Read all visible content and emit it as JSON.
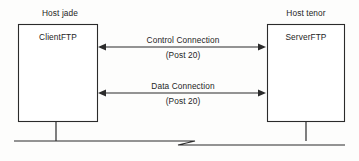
{
  "diagram": {
    "type": "network-diagram",
    "colors": {
      "line": "#2b2b2b",
      "text": "#242424",
      "background": "#fdfdfc",
      "box_fill": "#ffffff"
    },
    "hosts": [
      {
        "id": "left",
        "caption": "Host jade",
        "node_name": "ClientFTP",
        "role": "client"
      },
      {
        "id": "right",
        "caption": "Host tenor",
        "node_name": "ServerFTP",
        "role": "server"
      }
    ],
    "connections": [
      {
        "id": "control",
        "title": "Control Connection",
        "port": "(Post 20)",
        "direction": "bidirectional"
      },
      {
        "id": "data",
        "title": "Data Connection",
        "port": "(Post 20)",
        "direction": "bidirectional"
      }
    ],
    "bus": {
      "label": "",
      "break_symbol": "z-break"
    }
  }
}
